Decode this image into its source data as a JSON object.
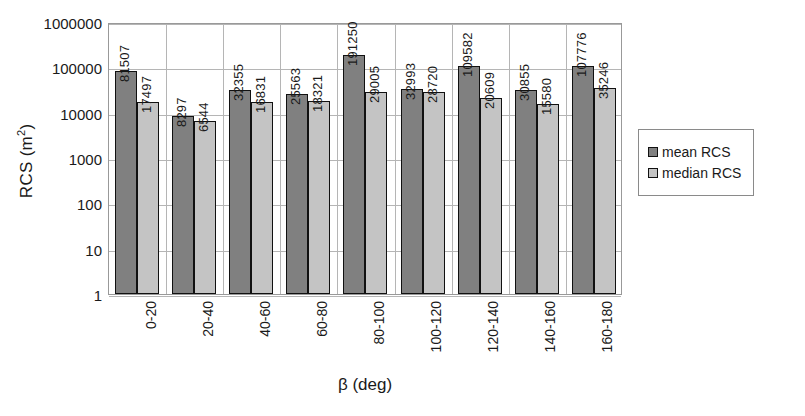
{
  "chart_data": {
    "type": "bar",
    "title": "",
    "xlabel": "β (deg)",
    "ylabel": "RCS (m²)",
    "ylabel_base": "RCS (m",
    "ylabel_sup": "2",
    "ylabel_close": ")",
    "scale": "log",
    "ylim": [
      1,
      1000000
    ],
    "grid": true,
    "legend_position": "right",
    "categories": [
      "0-20",
      "20-40",
      "40-60",
      "60-80",
      "80-100",
      "100-120",
      "120-140",
      "140-160",
      "160-180"
    ],
    "y_ticks": [
      "1000000",
      "100000",
      "10000",
      "1000",
      "100",
      "10",
      "1"
    ],
    "y_tick_values": [
      1000000,
      100000,
      10000,
      1000,
      100,
      10,
      1
    ],
    "series": [
      {
        "name": "mean RCS",
        "color": "#808080",
        "values": [
          81507,
          8297,
          32355,
          25563,
          191250,
          32993,
          109582,
          30855,
          107776
        ],
        "labels": [
          "81507",
          "8297",
          "32355",
          "25563",
          "191250",
          "32993",
          "109582",
          "30855",
          "107776"
        ]
      },
      {
        "name": "median RCS",
        "color": "#c4c4c4",
        "values": [
          17497,
          6544,
          16831,
          18321,
          29005,
          28720,
          20609,
          15580,
          35246
        ],
        "labels": [
          "17497",
          "6544",
          "16831",
          "18321",
          "29005",
          "28720",
          "20609",
          "15580",
          "35246"
        ]
      }
    ]
  },
  "legend": {
    "items": [
      {
        "label": "mean RCS",
        "color": "#808080"
      },
      {
        "label": "median RCS",
        "color": "#c4c4c4"
      }
    ]
  },
  "colors": {
    "mean": "#808080",
    "median": "#c4c4c4",
    "grid": "#b5b5b5",
    "axis": "#999999",
    "bar_outline": "#111111",
    "text": "#1a1a1a"
  }
}
